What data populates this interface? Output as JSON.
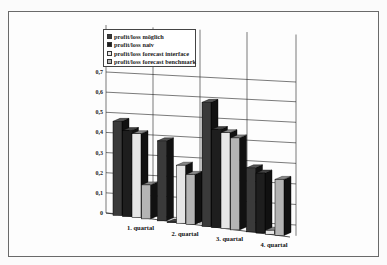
{
  "chart_data": {
    "type": "bar",
    "title": "",
    "xlabel": "",
    "ylabel": "",
    "ylim": [
      0,
      0.7
    ],
    "yticks": [
      "0",
      "0,1",
      "0,2",
      "0,3",
      "0,4",
      "0,5",
      "0,6",
      "0,7"
    ],
    "grid": true,
    "legend_position": "top-left inside",
    "categories": [
      "1. quartal",
      "2. quartal",
      "3. quartal",
      "4. quartal"
    ],
    "series": [
      {
        "name": "profit/loss möglich",
        "values": [
          0.47,
          0.4,
          0.62,
          0.32
        ],
        "color": "#3a3a3a"
      },
      {
        "name": "profit/loss naiv",
        "values": [
          0.43,
          0.0,
          0.49,
          0.3
        ],
        "color": "#1e1e1e"
      },
      {
        "name": "profit/loss forecast interface",
        "values": [
          0.42,
          0.29,
          0.48,
          0.02
        ],
        "color": "#e6e6e6"
      },
      {
        "name": "profit/loss forecast benchmark",
        "values": [
          0.17,
          0.25,
          0.46,
          0.28
        ],
        "color": "#b4b4b4"
      }
    ]
  }
}
